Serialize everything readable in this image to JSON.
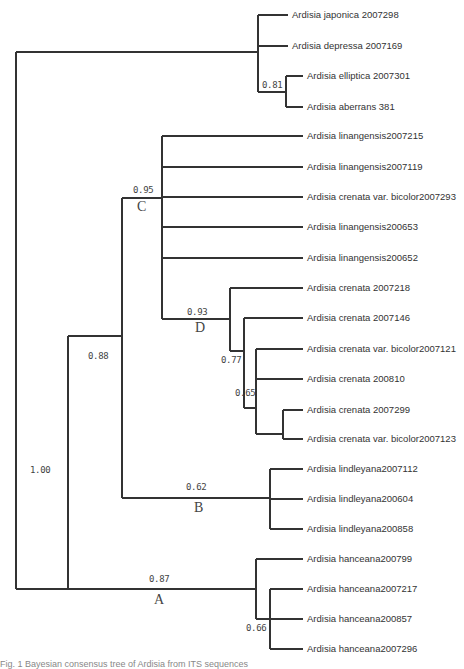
{
  "chart_data": {
    "type": "phylogenetic_tree",
    "title": "",
    "tips": [
      "Ardisia japonica 2007298",
      "Ardisia depressa 2007169",
      "Ardisia elliptica 2007301",
      "Ardisia aberrans 381",
      "Ardisia linangensis2007215",
      "Ardisia linangensis2007119",
      "Ardisia crenata var. bicolor2007293",
      "Ardisia linangensis200653",
      "Ardisia linangensis200652",
      "Ardisia crenata 2007218",
      "Ardisia crenata 2007146",
      "Ardisia crenata var. bicolor2007121",
      "Ardisia crenata 200810",
      "Ardisia crenata 2007299",
      "Ardisia crenata var. bicolor2007123",
      "Ardisia lindleyana2007112",
      "Ardisia lindleyana200604",
      "Ardisia lindleyana200858",
      "Ardisia hanceana200799",
      "Ardisia hanceana2007217",
      "Ardisia hanceana200857",
      "Ardisia hanceana2007296"
    ],
    "support_values": [
      {
        "node": "elliptica+aberrans",
        "value": "0.81"
      },
      {
        "node": "root-ingroup",
        "value": "1.00"
      },
      {
        "node": "B+C",
        "value": "0.88"
      },
      {
        "node": "C",
        "value": "0.95"
      },
      {
        "node": "D",
        "value": "0.93"
      },
      {
        "node": "crenata-inner",
        "value": "0.77"
      },
      {
        "node": "crenata-inner2",
        "value": "0.65"
      },
      {
        "node": "B",
        "value": "0.62"
      },
      {
        "node": "A",
        "value": "0.87"
      },
      {
        "node": "hanceana-inner",
        "value": "0.66"
      }
    ],
    "clade_labels": [
      "A",
      "B",
      "C",
      "D"
    ]
  },
  "tree": {
    "tips": [
      {
        "label": "Ardisia japonica 2007298",
        "x": 288,
        "y": 15
      },
      {
        "label": "Ardisia depressa 2007169",
        "x": 288,
        "y": 46
      },
      {
        "label": "Ardisia elliptica 2007301",
        "x": 303,
        "y": 76
      },
      {
        "label": "Ardisia aberrans 381",
        "x": 303,
        "y": 107
      },
      {
        "label": "Ardisia linangensis2007215",
        "x": 303,
        "y": 136
      },
      {
        "label": "Ardisia linangensis2007119",
        "x": 303,
        "y": 167
      },
      {
        "label": "Ardisia crenata var. bicolor2007293",
        "x": 303,
        "y": 197
      },
      {
        "label": "Ardisia linangensis200653",
        "x": 303,
        "y": 227
      },
      {
        "label": "Ardisia linangensis200652",
        "x": 303,
        "y": 258
      },
      {
        "label": "Ardisia crenata 2007218",
        "x": 303,
        "y": 288
      },
      {
        "label": "Ardisia crenata 2007146",
        "x": 303,
        "y": 318
      },
      {
        "label": "Ardisia crenata var. bicolor2007121",
        "x": 303,
        "y": 349
      },
      {
        "label": "Ardisia crenata 200810",
        "x": 303,
        "y": 379
      },
      {
        "label": "Ardisia crenata 2007299",
        "x": 303,
        "y": 410
      },
      {
        "label": "Ardisia crenata var. bicolor2007123",
        "x": 303,
        "y": 439
      },
      {
        "label": "Ardisia lindleyana2007112",
        "x": 303,
        "y": 469
      },
      {
        "label": "Ardisia lindleyana200604",
        "x": 303,
        "y": 499
      },
      {
        "label": "Ardisia lindleyana200858",
        "x": 303,
        "y": 529
      },
      {
        "label": "Ardisia hanceana200799",
        "x": 303,
        "y": 559
      },
      {
        "label": "Ardisia hanceana2007217",
        "x": 303,
        "y": 589
      },
      {
        "label": "Ardisia hanceana200857",
        "x": 303,
        "y": 619
      },
      {
        "label": "Ardisia hanceana2007296",
        "x": 303,
        "y": 649
      }
    ],
    "supports": [
      {
        "value": "0.81",
        "x": 262,
        "y": 80
      },
      {
        "value": "1.00",
        "x": 30,
        "y": 465
      },
      {
        "value": "0.88",
        "x": 88,
        "y": 351
      },
      {
        "value": "0.95",
        "x": 133,
        "y": 185
      },
      {
        "value": "0.93",
        "x": 187,
        "y": 307
      },
      {
        "value": "0.77",
        "x": 221,
        "y": 355
      },
      {
        "value": "0.65",
        "x": 235,
        "y": 388
      },
      {
        "value": "0.62",
        "x": 186,
        "y": 482
      },
      {
        "value": "0.87",
        "x": 149,
        "y": 574
      },
      {
        "value": "0.66",
        "x": 246,
        "y": 623
      }
    ],
    "clades": [
      {
        "label": "C",
        "x": 137,
        "y": 199
      },
      {
        "label": "D",
        "x": 195,
        "y": 320
      },
      {
        "label": "B",
        "x": 194,
        "y": 500
      },
      {
        "label": "A",
        "x": 154,
        "y": 592
      }
    ]
  },
  "caption": "Fig. 1  Bayesian consensus tree of Ardisia from ITS sequences"
}
